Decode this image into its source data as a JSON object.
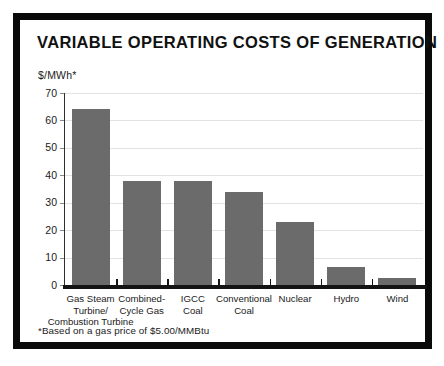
{
  "frame": {
    "border_color": "#0a0a0a"
  },
  "chart_data": {
    "type": "bar",
    "title": "VARIABLE OPERATING COSTS OF GENERATION",
    "ylabel": "$/MWh*",
    "xlabel": "",
    "categories": [
      "Gas Steam Turbine/ Combustion Turbine",
      "Combined-Cycle Gas",
      "IGCC Coal",
      "Conventional Coal",
      "Nuclear",
      "Hydro",
      "Wind"
    ],
    "category_lines": [
      [
        "Gas Steam",
        "Turbine/",
        "Combustion Turbine"
      ],
      [
        "Combined-",
        "Cycle Gas"
      ],
      [
        "IGCC",
        "Coal"
      ],
      [
        "Conventional",
        "Coal"
      ],
      [
        "Nuclear"
      ],
      [
        "Hydro"
      ],
      [
        "Wind"
      ]
    ],
    "values": [
      64,
      38,
      38,
      34,
      23,
      6.5,
      2.5
    ],
    "ylim": [
      0,
      70
    ],
    "ytick_labels": [
      "70",
      "60",
      "50",
      "40",
      "30",
      "20",
      "10",
      "0"
    ],
    "ytick_values": [
      70,
      60,
      50,
      40,
      30,
      20,
      10,
      0
    ],
    "grid": true,
    "legend": "none",
    "bar_color": "#6b6b6b",
    "gridline_color": "#e2e2e2",
    "axis_color": "#141414"
  },
  "footnote": "*Based on a gas price of $5.00/MMBtu"
}
